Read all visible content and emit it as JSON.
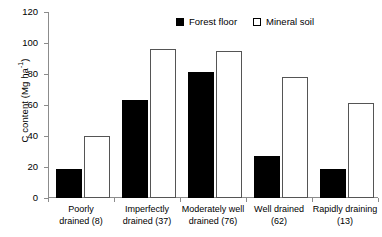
{
  "chart_data": {
    "type": "bar",
    "title": "",
    "xlabel": "",
    "ylabel": "C content (Mg ha⁻¹)",
    "ylabel_text": "C content (Mg ha",
    "ylabel_exponent": "-1",
    "ylabel_tail": ")",
    "ylim": [
      0,
      120
    ],
    "yticks": [
      0,
      20,
      40,
      60,
      80,
      100,
      120
    ],
    "ytick_labels": [
      "0",
      "20",
      "40",
      "60",
      "80",
      "100",
      "120"
    ],
    "grid": false,
    "legend_position": "top-center",
    "categories": [
      "Poorly drained (8)",
      "Imperfectly drained (37)",
      "Moderately well drained (76)",
      "Well drained (62)",
      "Rapidly draining (13)"
    ],
    "category_lines": [
      [
        "Poorly",
        "drained (8)"
      ],
      [
        "Imperfectly",
        "drained (37)"
      ],
      [
        "Moderately well",
        "drained (76)"
      ],
      [
        "Well drained",
        "(62)"
      ],
      [
        "Rapidly draining",
        "(13)"
      ]
    ],
    "series": [
      {
        "name": "Forest floor",
        "style": "filled",
        "color": "#000000",
        "values": [
          19,
          63,
          81,
          27,
          19
        ]
      },
      {
        "name": "Mineral soil",
        "style": "open",
        "color": "#ffffff",
        "edgecolor": "#555555",
        "values": [
          40,
          96,
          95,
          78,
          61
        ]
      }
    ]
  },
  "legend": {
    "items": [
      {
        "label": "Forest floor",
        "swatch": "filled-square"
      },
      {
        "label": "Mineral soil",
        "swatch": "open-square"
      }
    ]
  },
  "colors": {
    "axis": "#8c8c8c",
    "text": "#000000",
    "background": "#ffffff",
    "forest_floor": "#000000",
    "mineral_soil_edge": "#555555"
  }
}
